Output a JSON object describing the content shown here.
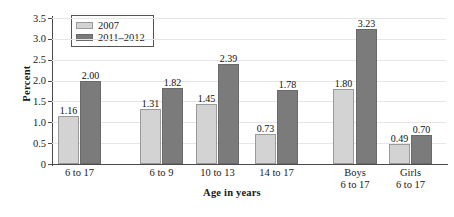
{
  "chart_data": {
    "type": "bar",
    "title": "",
    "xlabel": "Age in years",
    "ylabel": "Percent",
    "ylim": [
      0,
      3.5
    ],
    "yticks": [
      "3.5",
      "3.0",
      "2.5",
      "2.0",
      "1.5",
      "1.0",
      "0.5",
      "0"
    ],
    "grid": true,
    "legend_position": "top-left",
    "categories": [
      {
        "line1": "6 to 17",
        "line2": ""
      },
      {
        "line1": "6 to 9",
        "line2": ""
      },
      {
        "line1": "10 to 13",
        "line2": ""
      },
      {
        "line1": "14 to 17",
        "line2": ""
      },
      {
        "line1": "Boys",
        "line2": "6 to 17"
      },
      {
        "line1": "Girls",
        "line2": "6 to 17"
      }
    ],
    "series": [
      {
        "name": "2007",
        "color": "#d3d3d3",
        "values": [
          1.16,
          1.31,
          1.45,
          0.73,
          1.8,
          0.49
        ],
        "labels": [
          "1.16",
          "1.31",
          "1.45",
          "0.73",
          "1.80",
          "0.49"
        ]
      },
      {
        "name": "2011–2012",
        "color": "#7b7b7b",
        "values": [
          2.0,
          1.82,
          2.39,
          1.78,
          3.23,
          0.7
        ],
        "labels": [
          "2.00",
          "1.82",
          "2.39",
          "1.78",
          "3.23",
          "0.70"
        ]
      }
    ]
  },
  "legend": {
    "items": [
      {
        "label": "2007",
        "swatch": "light-gray-swatch"
      },
      {
        "label": "2011–2012",
        "swatch": "dark-gray-swatch"
      }
    ]
  }
}
